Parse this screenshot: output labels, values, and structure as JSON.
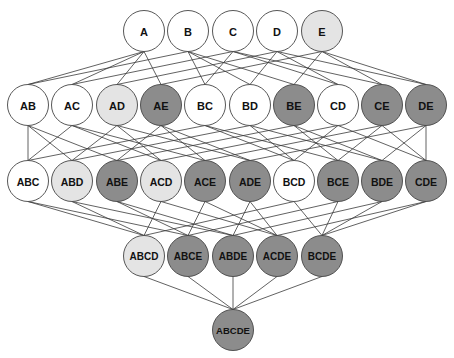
{
  "diagram": {
    "type": "subset-lattice",
    "colors": {
      "white": "#ffffff",
      "light": "#e4e4e4",
      "dark": "#8c8c8c",
      "stroke": "#444444",
      "edge": "#3a3a3a"
    },
    "radius": 20.5,
    "rows": [
      {
        "y": 31,
        "font_size": 11,
        "nodes": [
          {
            "label": "A",
            "x": 144,
            "fill": "white"
          },
          {
            "label": "B",
            "x": 188,
            "fill": "white"
          },
          {
            "label": "C",
            "x": 233,
            "fill": "white"
          },
          {
            "label": "D",
            "x": 277,
            "fill": "white"
          },
          {
            "label": "E",
            "x": 322,
            "fill": "light"
          }
        ]
      },
      {
        "y": 105,
        "font_size": 11,
        "nodes": [
          {
            "label": "AB",
            "x": 28,
            "fill": "white"
          },
          {
            "label": "AC",
            "x": 72,
            "fill": "white"
          },
          {
            "label": "AD",
            "x": 117,
            "fill": "light"
          },
          {
            "label": "AE",
            "x": 161,
            "fill": "dark"
          },
          {
            "label": "BC",
            "x": 205,
            "fill": "white"
          },
          {
            "label": "BD",
            "x": 250,
            "fill": "white"
          },
          {
            "label": "BE",
            "x": 294,
            "fill": "dark"
          },
          {
            "label": "CD",
            "x": 338,
            "fill": "white"
          },
          {
            "label": "CE",
            "x": 382,
            "fill": "dark"
          },
          {
            "label": "DE",
            "x": 426,
            "fill": "dark"
          }
        ]
      },
      {
        "y": 181,
        "font_size": 10.5,
        "nodes": [
          {
            "label": "ABC",
            "x": 28,
            "fill": "white"
          },
          {
            "label": "ABD",
            "x": 72,
            "fill": "light"
          },
          {
            "label": "ABE",
            "x": 117,
            "fill": "dark"
          },
          {
            "label": "ACD",
            "x": 161,
            "fill": "light"
          },
          {
            "label": "ACE",
            "x": 205,
            "fill": "dark"
          },
          {
            "label": "ADE",
            "x": 250,
            "fill": "dark"
          },
          {
            "label": "BCD",
            "x": 294,
            "fill": "white"
          },
          {
            "label": "BCE",
            "x": 338,
            "fill": "dark"
          },
          {
            "label": "BDE",
            "x": 382,
            "fill": "dark"
          },
          {
            "label": "CDE",
            "x": 426,
            "fill": "dark"
          }
        ]
      },
      {
        "y": 256,
        "font_size": 10,
        "nodes": [
          {
            "label": "ABCD",
            "x": 144,
            "fill": "light"
          },
          {
            "label": "ABCE",
            "x": 188,
            "fill": "dark"
          },
          {
            "label": "ABDE",
            "x": 233,
            "fill": "dark"
          },
          {
            "label": "ACDE",
            "x": 277,
            "fill": "dark"
          },
          {
            "label": "BCDE",
            "x": 322,
            "fill": "dark"
          }
        ]
      },
      {
        "y": 330,
        "font_size": 9.5,
        "nodes": [
          {
            "label": "ABCDE",
            "x": 233,
            "fill": "dark"
          }
        ]
      }
    ]
  }
}
